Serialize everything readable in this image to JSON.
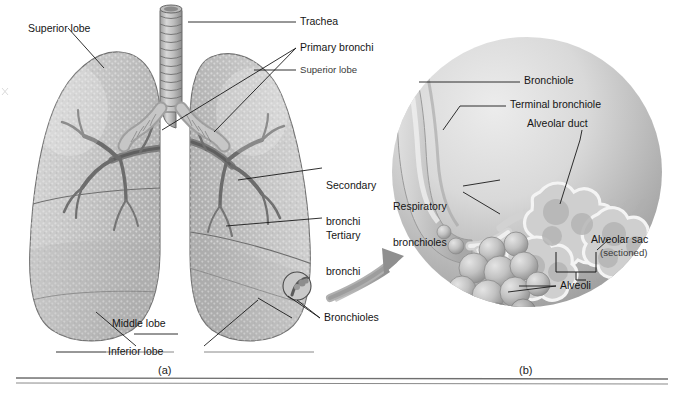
{
  "figure": {
    "panels": [
      {
        "id": "a",
        "caption": "(a)",
        "description": "Lungs with trachea and bronchial tree"
      },
      {
        "id": "b",
        "caption": "(b)",
        "description": "Magnified respiratory bronchiole and alveoli"
      }
    ]
  },
  "panel_a": {
    "caption": "(a)",
    "labels": {
      "superior_lobe_left": "Superior lobe",
      "trachea": "Trachea",
      "primary_bronchi": "Primary bronchi",
      "superior_lobe_right": "Superior lobe",
      "secondary_bronchi_l1": "Secondary",
      "secondary_bronchi_l2": "bronchi",
      "tertiary_bronchi_l1": "Tertiary",
      "tertiary_bronchi_l2": "bronchi",
      "bronchioles": "Bronchioles",
      "middle_lobe": "Middle lobe",
      "inferior_lobe": "Inferior lobe"
    }
  },
  "panel_b": {
    "caption": "(b)",
    "labels": {
      "bronchiole": "Bronchiole",
      "terminal_bronchiole": "Terminal bronchiole",
      "alveolar_duct": "Alveolar duct",
      "respiratory_bronchioles_l1": "Respiratory",
      "respiratory_bronchioles_l2": "bronchioles",
      "alveolar_sac": "Alveolar sac",
      "alveolar_sac_sub": "(sectioned)",
      "alveoli": "Alveoli"
    }
  },
  "colors": {
    "tissue_light": "#d6d6d6",
    "tissue_mid": "#bcbcbc",
    "tissue_dark": "#8f8f8f",
    "outline": "#6a6a6a",
    "leader": "#1a1a1a",
    "arrow": "#9a9a9a",
    "circle_light": "#e2e2e2",
    "circle_dark": "#9d9d9d",
    "rule": "#6f6f6f",
    "background": "#ffffff"
  }
}
